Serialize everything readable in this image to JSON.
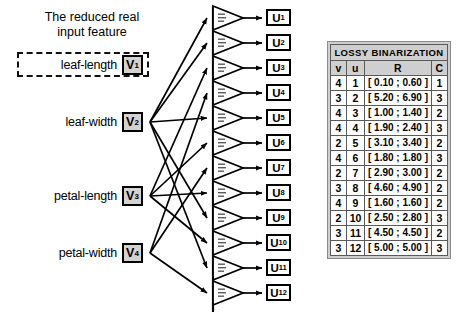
{
  "caption": {
    "line1": "The reduced real",
    "line2": "input feature"
  },
  "inputs": [
    {
      "label": "leaf-length",
      "node": "V",
      "sub": "1",
      "boxed_dashed": true
    },
    {
      "label": "leaf-width",
      "node": "V",
      "sub": "2",
      "boxed_dashed": false
    },
    {
      "label": "petal-length",
      "node": "V",
      "sub": "3",
      "boxed_dashed": false
    },
    {
      "label": "petal-width",
      "node": "V",
      "sub": "4",
      "boxed_dashed": false
    }
  ],
  "outputs": [
    {
      "node": "U",
      "sub": "1"
    },
    {
      "node": "U",
      "sub": "2"
    },
    {
      "node": "U",
      "sub": "3"
    },
    {
      "node": "U",
      "sub": "4"
    },
    {
      "node": "U",
      "sub": "5"
    },
    {
      "node": "U",
      "sub": "6"
    },
    {
      "node": "U",
      "sub": "7"
    },
    {
      "node": "U",
      "sub": "8"
    },
    {
      "node": "U",
      "sub": "9"
    },
    {
      "node": "U",
      "sub": "10"
    },
    {
      "node": "U",
      "sub": "11"
    },
    {
      "node": "U",
      "sub": "12"
    }
  ],
  "table": {
    "title": "LOSSY BINARIZATION",
    "columns": [
      "v",
      "u",
      "R",
      "C"
    ],
    "rows": [
      [
        "4",
        "1",
        "[ 0.10 ; 0.60 ]",
        "1"
      ],
      [
        "3",
        "2",
        "[ 5.20 ; 6.90 ]",
        "3"
      ],
      [
        "4",
        "3",
        "[ 1.00 ; 1.40 ]",
        "2"
      ],
      [
        "4",
        "4",
        "[ 1.90 ; 2.40 ]",
        "3"
      ],
      [
        "2",
        "5",
        "[ 3.10 ; 3.40 ]",
        "2"
      ],
      [
        "4",
        "6",
        "[ 1.80 ; 1.80 ]",
        "3"
      ],
      [
        "2",
        "7",
        "[ 2.90 ; 3.00 ]",
        "2"
      ],
      [
        "3",
        "8",
        "[ 4.60 ; 4.90 ]",
        "2"
      ],
      [
        "4",
        "9",
        "[ 1.60 ; 1.60 ]",
        "2"
      ],
      [
        "2",
        "10",
        "[ 2.50 ; 2.80 ]",
        "3"
      ],
      [
        "3",
        "11",
        "[ 4.50 ; 4.50 ]",
        "2"
      ],
      [
        "3",
        "12",
        "[ 5.00 ; 5.00 ]",
        "3"
      ]
    ]
  },
  "colors": {
    "node_fill": "#d2d2d2",
    "header_fill": "#cfcfcf",
    "stroke": "#000000"
  }
}
